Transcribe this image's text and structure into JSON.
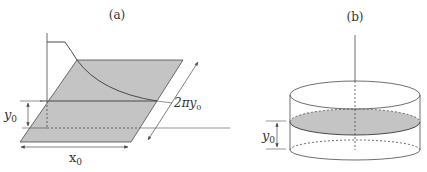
{
  "figure_a": {
    "label": "(a)",
    "dim_y": "y",
    "dim_y_sub": "0",
    "dim_x": "x",
    "dim_x_sub": "0",
    "dim_circ_prefix": "2πy",
    "dim_circ_sub": "0"
  },
  "figure_b": {
    "label": "(b)",
    "dim_y": "y",
    "dim_y_sub": "0"
  },
  "colors": {
    "line": "#4a4a4a",
    "fill": "#c4c4c4",
    "background": "#ffffff"
  }
}
